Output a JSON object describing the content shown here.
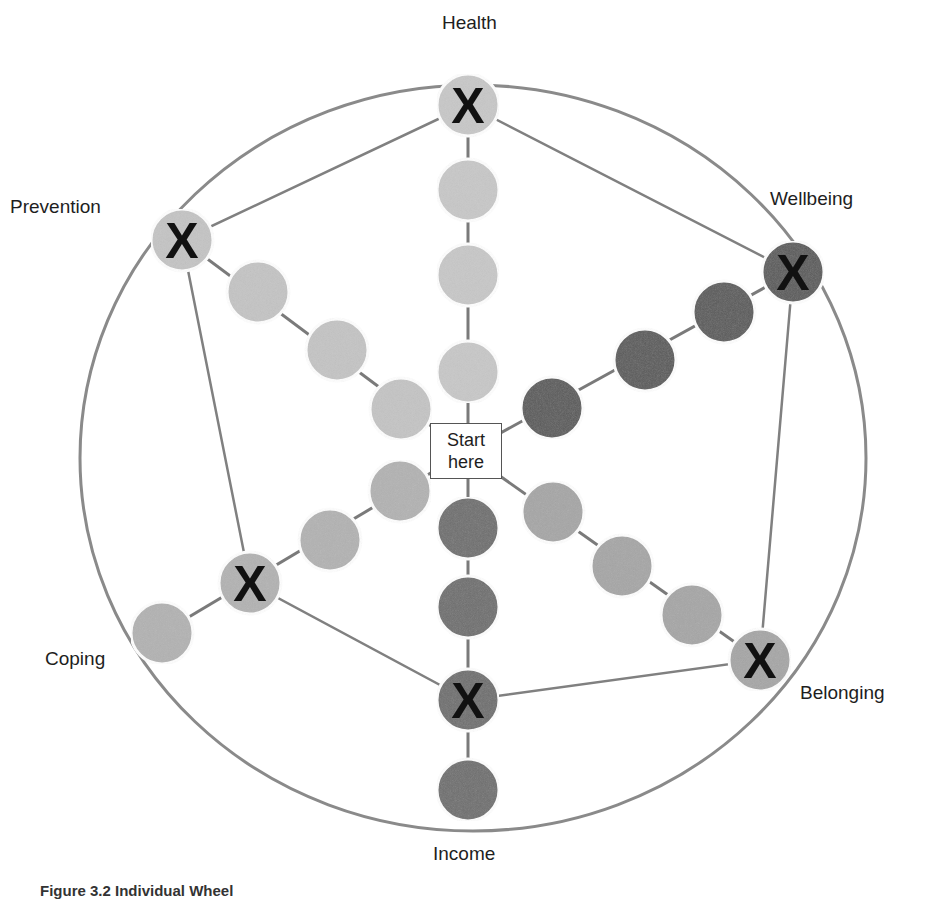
{
  "diagram": {
    "start_label_line1": "Start",
    "start_label_line2": "here",
    "caption": "Figure 3.2 Individual Wheel",
    "colors": {
      "outline": "#8a8a8a",
      "circle_light": "#c8c8c8",
      "circle_medium": "#a6a6a6",
      "circle_dark": "#6e6e6e",
      "circle_darker": "#5a5a5a",
      "x_mark": "#111111"
    },
    "mark_symbol": "X",
    "dimensions": [
      {
        "name": "Health",
        "label_pos": [
          442,
          12
        ],
        "color": "circle_light",
        "marked_level": 4,
        "levels": 4
      },
      {
        "name": "Wellbeing",
        "label_pos": [
          770,
          188
        ],
        "color": "circle_darker",
        "marked_level": 4,
        "levels": 4
      },
      {
        "name": "Belonging",
        "label_pos": [
          800,
          682
        ],
        "color": "circle_medium",
        "marked_level": 4,
        "levels": 4
      },
      {
        "name": "Income",
        "label_pos": [
          433,
          843
        ],
        "color": "circle_dark",
        "marked_level": 3,
        "levels": 4
      },
      {
        "name": "Coping",
        "label_pos": [
          45,
          648
        ],
        "color": "circle_medium",
        "marked_level": 3,
        "levels": 4
      },
      {
        "name": "Prevention",
        "label_pos": [
          10,
          196
        ],
        "color": "circle_light",
        "marked_level": 4,
        "levels": 4
      }
    ]
  }
}
